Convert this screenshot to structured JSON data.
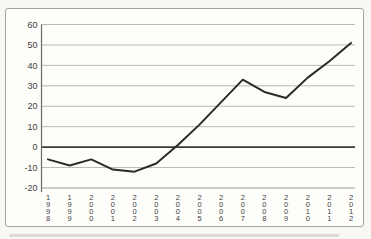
{
  "page": {
    "background": "#f8f7f4",
    "panel_background": "#fdfdfa",
    "panel_border_color": "#a6a3a0"
  },
  "chart_data": {
    "type": "line",
    "title": "",
    "xlabel": "",
    "ylabel": "",
    "categories": [
      "1998",
      "1999",
      "2000",
      "2001",
      "2002",
      "2003",
      "2004",
      "2005",
      "2006",
      "2007",
      "2008",
      "2009",
      "2010",
      "2011",
      "2012"
    ],
    "values": [
      -6,
      -9,
      -6,
      -11,
      -12,
      -8,
      1,
      11,
      22,
      33,
      27,
      24,
      34,
      42,
      51
    ],
    "ylim": [
      -20,
      60
    ],
    "yticks": [
      60,
      50,
      40,
      30,
      20,
      10,
      0,
      -10,
      -20
    ],
    "grid": true,
    "legend": "none",
    "x_label_orientation": "vertical-stacked",
    "colors": {
      "line": "#2a2a2a",
      "gridline": "#b8b8b8",
      "bottom_gridline": "#9a9a9a",
      "zero_line": "#3a3a3a",
      "axis": "#6a6a6a",
      "tick_label": "#3f3f3f"
    }
  }
}
